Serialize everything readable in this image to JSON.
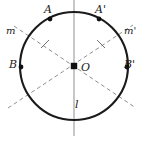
{
  "figure": {
    "colors": {
      "stroke": "#1a1a1a",
      "dashed": "#8a8a8a",
      "axis": "#9a9a9a",
      "background": "#ffffff"
    },
    "geometry": {
      "width": 143,
      "height": 146,
      "circle": {
        "cx": 74,
        "cy": 66,
        "r": 54
      },
      "axis_line_l": {
        "x1": 74,
        "y1": 0,
        "x2": 74,
        "y2": 136
      },
      "dashed_line_m": {
        "x1": 14,
        "y1": 26,
        "x2": 136,
        "y2": 108
      },
      "dashed_line_m_prime": {
        "x1": 8,
        "y1": 108,
        "x2": 133,
        "y2": 25
      }
    },
    "points": [
      {
        "id": "A",
        "label": "A",
        "x": 50,
        "y": 19,
        "marker": "dot"
      },
      {
        "id": "Ap",
        "label": "A'",
        "x": 99,
        "y": 19,
        "marker": "dot"
      },
      {
        "id": "B",
        "label": "B",
        "x": 21,
        "y": 67,
        "marker": "dot"
      },
      {
        "id": "Bp",
        "label": "B'",
        "x": 127,
        "y": 67,
        "marker": "dot"
      },
      {
        "id": "O",
        "label": "O",
        "x": 74,
        "y": 66,
        "marker": "square"
      }
    ],
    "lines": [
      {
        "id": "l",
        "label": "l",
        "style": "solid-thin"
      },
      {
        "id": "m",
        "label": "m",
        "style": "dashed"
      },
      {
        "id": "mp",
        "label": "m'",
        "style": "dashed"
      }
    ],
    "tick_marks": [
      {
        "on": "m-prime-upper-left",
        "x": 45,
        "y": 44
      },
      {
        "on": "m-upper-right",
        "x": 101,
        "y": 44
      }
    ],
    "labels": {
      "A": "A",
      "A_prime": "A'",
      "B": "B",
      "B_prime": "B'",
      "O": "O",
      "m": "m",
      "m_prime": "m'",
      "l": "l"
    }
  }
}
